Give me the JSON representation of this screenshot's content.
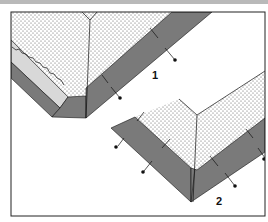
{
  "figure": {
    "labels": [
      {
        "id": "fig-1",
        "text": "1"
      },
      {
        "id": "fig-2",
        "text": "2"
      }
    ]
  },
  "colors": {
    "band": "#7a7a7a",
    "inner_band": "#d8d8d8",
    "dots": "#555555",
    "line": "#111111",
    "frame": "#222222",
    "background": "#ffffff"
  }
}
